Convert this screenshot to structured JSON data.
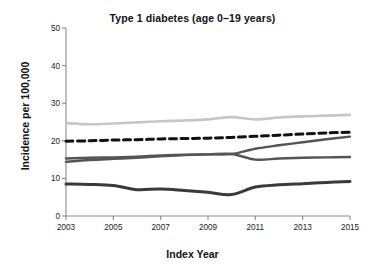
{
  "chart_data": {
    "type": "line",
    "title": "Type 1 diabetes (age 0–19 years)",
    "xlabel": "Index Year",
    "ylabel": "Incidence per 100,000",
    "xlim": [
      2003,
      2015
    ],
    "ylim": [
      0,
      50
    ],
    "grid": false,
    "legend": "none",
    "x": [
      2003,
      2004,
      2005,
      2006,
      2007,
      2008,
      2009,
      2010,
      2011,
      2012,
      2013,
      2014,
      2015
    ],
    "xticks": [
      "2003",
      "2005",
      "2007",
      "2009",
      "2011",
      "2013",
      "2015"
    ],
    "yticks": [
      "0",
      "10",
      "20",
      "30",
      "40",
      "50"
    ],
    "series": [
      {
        "name": "light-gray-upper",
        "color": "#c6c6c6",
        "style": "solid",
        "width": 2.6,
        "values": [
          24.7,
          24.4,
          24.6,
          24.9,
          25.2,
          25.4,
          25.7,
          26.3,
          25.7,
          26.2,
          26.5,
          26.7,
          26.9
        ]
      },
      {
        "name": "black-dashed",
        "color": "#111111",
        "style": "dashed",
        "width": 3.0,
        "values": [
          19.9,
          20.0,
          20.2,
          20.3,
          20.5,
          20.6,
          20.7,
          20.9,
          21.2,
          21.5,
          21.8,
          22.1,
          22.3
        ]
      },
      {
        "name": "dark-gray-rising",
        "color": "#555555",
        "style": "solid",
        "width": 2.4,
        "values": [
          15.3,
          15.5,
          15.6,
          15.8,
          16.1,
          16.3,
          16.4,
          16.5,
          17.9,
          18.8,
          19.6,
          20.4,
          21.1
        ]
      },
      {
        "name": "mid-gray-flat",
        "color": "#555555",
        "style": "solid",
        "width": 2.4,
        "values": [
          14.4,
          14.9,
          15.2,
          15.5,
          15.9,
          16.2,
          16.4,
          16.5,
          15.0,
          15.3,
          15.5,
          15.6,
          15.7
        ]
      },
      {
        "name": "black-lower",
        "color": "#3a3a3a",
        "style": "solid",
        "width": 3.0,
        "values": [
          8.5,
          8.4,
          8.1,
          7.0,
          7.2,
          6.8,
          6.3,
          5.7,
          7.7,
          8.3,
          8.6,
          8.9,
          9.2
        ]
      }
    ]
  },
  "axes": {
    "plot_left_px": 66,
    "plot_right_px": 350,
    "plot_top_px": 28,
    "plot_bottom_px": 216
  }
}
